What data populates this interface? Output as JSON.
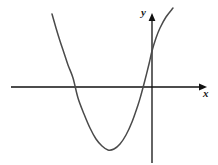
{
  "figure": {
    "name": "parabola-coordinate-plot",
    "background_color": "#ffffff",
    "width": 218,
    "height": 165,
    "axis_color": "#111111",
    "curve_color": "#4a4a4a",
    "axis_stroke_width": 1.3,
    "curve_stroke_width": 1.5
  },
  "labels": {
    "x_axis": "x",
    "y_axis": "y"
  },
  "chart_data": {
    "type": "line",
    "title": "",
    "subtitle": "",
    "xlabel": "x",
    "ylabel": "y",
    "grid": false,
    "legend": null,
    "annotations": [],
    "axes": {
      "x_axis": {
        "label": "x",
        "label_position": "right-end-below",
        "arrow": "right",
        "pixel_y": 87,
        "pixel_x_start": 11,
        "pixel_x_end": 207,
        "ticks": [],
        "tick_labels": []
      },
      "y_axis": {
        "label": "y",
        "label_position": "top-left-of-arrow",
        "arrow": "up",
        "pixel_x": 152,
        "pixel_y_start": 163,
        "pixel_y_end": 14,
        "ticks": [],
        "tick_labels": []
      },
      "origin_pixel": [
        152,
        87
      ]
    },
    "curve": {
      "name": "parabola",
      "shape": "quadratic",
      "opens": "up",
      "vertex_pixel": [
        108,
        150
      ],
      "root_left_pixel": [
        73,
        87
      ],
      "root_right_pixel": [
        141,
        87
      ],
      "y_intercept_pixel": [
        152,
        57
      ],
      "left_branch_end_pixel": [
        52,
        14
      ],
      "right_branch_end_pixel": [
        173,
        8
      ],
      "points_pixel": [
        [
          52,
          14
        ],
        [
          56,
          28
        ],
        [
          60,
          41
        ],
        [
          64,
          53
        ],
        [
          68,
          65
        ],
        [
          73,
          78
        ],
        [
          78,
          98
        ],
        [
          84,
          114
        ],
        [
          90,
          128
        ],
        [
          96,
          139
        ],
        [
          102,
          146
        ],
        [
          108,
          150
        ],
        [
          114,
          149
        ],
        [
          120,
          144
        ],
        [
          126,
          135
        ],
        [
          132,
          122
        ],
        [
          138,
          105
        ],
        [
          141,
          95
        ],
        [
          145,
          80
        ],
        [
          149,
          64
        ],
        [
          152,
          51
        ],
        [
          156,
          38
        ],
        [
          160,
          28
        ],
        [
          166,
          17
        ],
        [
          173,
          8
        ]
      ]
    }
  }
}
